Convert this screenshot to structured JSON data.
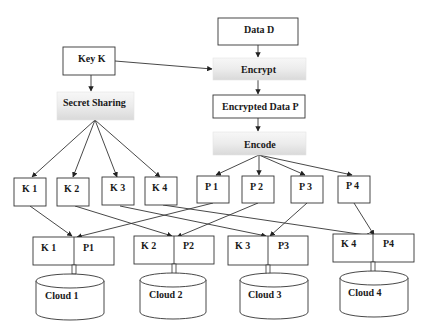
{
  "diagram": {
    "nodes": {
      "data_d": "Data D",
      "key_k": "Key K",
      "encrypt": "Encrypt",
      "encrypted_data_p": "Encrypted Data P",
      "secret_sharing": "Secret Sharing",
      "encode": "Encode"
    },
    "key_shares": [
      "K 1",
      "K 2",
      "K 3",
      "K 4"
    ],
    "data_shares": [
      "P 1",
      "P 2",
      "P 3",
      "P 4"
    ],
    "pairs": [
      {
        "k": "K 1",
        "p": "P1"
      },
      {
        "k": "K 2",
        "p": "P2"
      },
      {
        "k": "K 3",
        "p": "P3"
      },
      {
        "k": "K 4",
        "p": "P4"
      }
    ],
    "clouds": [
      "Cloud 1",
      "Cloud 2",
      "Cloud 3",
      "Cloud 4"
    ],
    "colors": {
      "stroke": "#333333",
      "gradient_light": "#fbfbfb",
      "gradient_dark": "#dcdcdc"
    }
  }
}
